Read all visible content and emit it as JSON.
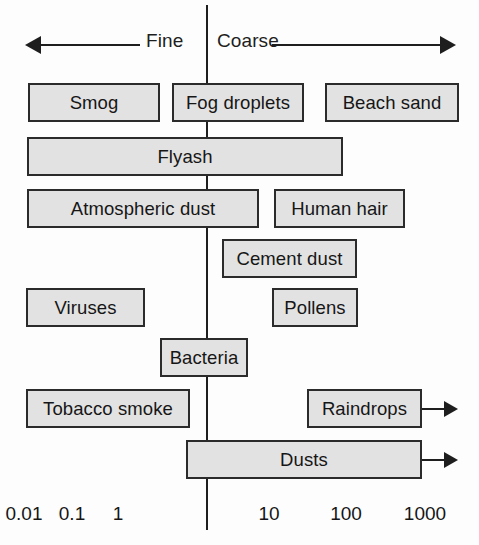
{
  "figure": {
    "axis_label": "Particle diameter (micrometres)",
    "colors": {
      "box_fill": "#e2e2e2",
      "box_border": "#2b2b2b",
      "line": "#1e1e1e",
      "text": "#161616",
      "background": "#fdfdfd"
    }
  },
  "header": {
    "fine_label": "Fine",
    "coarse_label": "Coarse",
    "left_arrow_icon": "arrow-left-icon",
    "right_arrow_icon": "arrow-right-icon"
  },
  "axis": {
    "scale": "logarithmic",
    "ticks": [
      {
        "label": "0.01",
        "x": 24
      },
      {
        "label": "0.1",
        "x": 72
      },
      {
        "label": "1",
        "x": 118
      },
      {
        "label": "10",
        "x": 269
      },
      {
        "label": "100",
        "x": 346
      },
      {
        "label": "1000",
        "x": 425
      }
    ],
    "divider_value": "1"
  },
  "boxes": [
    {
      "label": "Smog",
      "row": 1,
      "left": 28,
      "width": 132,
      "open_ended": false
    },
    {
      "label": "Fog droplets",
      "row": 1,
      "left": 172,
      "width": 132,
      "open_ended": false
    },
    {
      "label": "Beach sand",
      "row": 1,
      "left": 325,
      "width": 134,
      "open_ended": false
    },
    {
      "label": "Flyash",
      "row": 2,
      "left": 27,
      "width": 316,
      "open_ended": false
    },
    {
      "label": "Atmospheric dust",
      "row": 3,
      "left": 27,
      "width": 232,
      "open_ended": false
    },
    {
      "label": "Human hair",
      "row": 3,
      "left": 274,
      "width": 131,
      "open_ended": false
    },
    {
      "label": "Cement dust",
      "row": 4,
      "left": 222,
      "width": 135,
      "open_ended": false
    },
    {
      "label": "Viruses",
      "row": 5,
      "left": 26,
      "width": 119,
      "open_ended": false
    },
    {
      "label": "Pollens",
      "row": 5,
      "left": 272,
      "width": 86,
      "open_ended": false
    },
    {
      "label": "Bacteria",
      "row": 6,
      "left": 160,
      "width": 88,
      "open_ended": false
    },
    {
      "label": "Tobacco smoke",
      "row": 7,
      "left": 26,
      "width": 164,
      "open_ended": false
    },
    {
      "label": "Raindrops",
      "row": 7,
      "left": 307,
      "width": 115,
      "open_ended": true
    },
    {
      "label": "Dusts",
      "row": 8,
      "left": 186,
      "width": 236,
      "open_ended": true
    }
  ],
  "chart_data": {
    "type": "bar",
    "xlabel": "Particle diameter (micrometres)",
    "ylabel": "",
    "xscale": "log",
    "xlim": [
      0.01,
      1000
    ],
    "grid": false,
    "legend": null,
    "annotations": [
      "Fine",
      "Coarse"
    ],
    "tick_labels": [
      "0.01",
      "0.1",
      "1",
      "10",
      "100",
      "1000"
    ],
    "categories": [
      "Smog",
      "Fog droplets",
      "Beach sand",
      "Flyash",
      "Atmospheric dust",
      "Human hair",
      "Cement dust",
      "Viruses",
      "Pollens",
      "Bacteria",
      "Tobacco smoke",
      "Raindrops",
      "Dusts"
    ],
    "ranges_um": [
      {
        "name": "Smog",
        "min": 0.01,
        "max": 1,
        "open_ended": false
      },
      {
        "name": "Fog droplets",
        "min": 1,
        "max": 10,
        "open_ended": false
      },
      {
        "name": "Beach sand",
        "min": 100,
        "max": 2000,
        "open_ended": false
      },
      {
        "name": "Flyash",
        "min": 0.01,
        "max": 100,
        "open_ended": false
      },
      {
        "name": "Atmospheric dust",
        "min": 0.01,
        "max": 10,
        "open_ended": false
      },
      {
        "name": "Human hair",
        "min": 20,
        "max": 500,
        "open_ended": false
      },
      {
        "name": "Cement dust",
        "min": 3,
        "max": 100,
        "open_ended": false
      },
      {
        "name": "Viruses",
        "min": 0.005,
        "max": 0.5,
        "open_ended": false
      },
      {
        "name": "Pollens",
        "min": 10,
        "max": 100,
        "open_ended": false
      },
      {
        "name": "Bacteria",
        "min": 0.3,
        "max": 3,
        "open_ended": false
      },
      {
        "name": "Tobacco smoke",
        "min": 0.01,
        "max": 2,
        "open_ended": false
      },
      {
        "name": "Raindrops",
        "min": 50,
        "max": 1000,
        "open_ended": true
      },
      {
        "name": "Dusts",
        "min": 1,
        "max": 1000,
        "open_ended": true
      }
    ]
  }
}
